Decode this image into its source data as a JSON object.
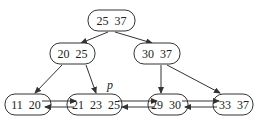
{
  "diagram": {
    "type": "B+ tree",
    "colors": {
      "stroke": "#333333",
      "text": "#222222",
      "background": "#ffffff"
    },
    "nodes": [
      {
        "id": "root",
        "level": 0,
        "keys": "25  37",
        "x": 88,
        "y": 10,
        "w": 47,
        "h": 21
      },
      {
        "id": "inner-left",
        "level": 1,
        "keys": "20  25",
        "x": 50,
        "y": 43,
        "w": 45,
        "h": 21
      },
      {
        "id": "inner-right",
        "level": 1,
        "keys": "30  37",
        "x": 134,
        "y": 43,
        "w": 46,
        "h": 21
      },
      {
        "id": "leaf-1",
        "level": 2,
        "keys": "11  20",
        "x": 5,
        "y": 94,
        "w": 46,
        "h": 21
      },
      {
        "id": "leaf-2",
        "level": 2,
        "keys": "21  23  25",
        "x": 67,
        "y": 94,
        "w": 55,
        "h": 21
      },
      {
        "id": "leaf-3",
        "level": 2,
        "keys": "29  30",
        "x": 148,
        "y": 94,
        "w": 40,
        "h": 21
      },
      {
        "id": "leaf-4",
        "level": 2,
        "keys": "33  37",
        "x": 213,
        "y": 94,
        "w": 40,
        "h": 21
      }
    ],
    "pointer_label": "p",
    "edges": [
      {
        "from": "root",
        "to": "inner-left"
      },
      {
        "from": "root",
        "to": "inner-right"
      },
      {
        "from": "inner-left",
        "to": "leaf-1"
      },
      {
        "from": "inner-left",
        "to": "leaf-2"
      },
      {
        "from": "inner-right",
        "to": "leaf-3"
      },
      {
        "from": "inner-right",
        "to": "leaf-4"
      }
    ],
    "sibling_links": [
      {
        "between": [
          "leaf-1",
          "leaf-2"
        ],
        "direction": "bidirectional"
      },
      {
        "between": [
          "leaf-2",
          "leaf-3"
        ],
        "direction": "bidirectional"
      },
      {
        "between": [
          "leaf-3",
          "leaf-4"
        ],
        "direction": "bidirectional"
      }
    ]
  }
}
